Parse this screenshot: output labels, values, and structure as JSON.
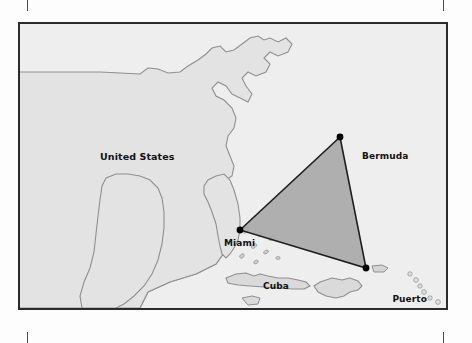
{
  "map": {
    "title": "Bermuda Triangle Map",
    "frame": {
      "border_color": "#2b2b2b"
    },
    "colors": {
      "ocean": "#eeeeee",
      "land": "#e3e3e3",
      "coastline": "#8f8f8f",
      "triangle_fill": "#a9a9a9",
      "triangle_stroke": "#1e1e1e",
      "label_text": "#111111",
      "marker": "#000000",
      "crop_mark": "#4a4a4a"
    },
    "labels": {
      "united_states": "United States",
      "bermuda": "Bermuda",
      "miami": "Miami",
      "cuba": "Cuba",
      "puerto_rico_line1": "Puerto",
      "puerto_rico_line2": "Rico"
    },
    "vertices": [
      {
        "name": "miami",
        "label": "Miami",
        "x": 238,
        "y": 228
      },
      {
        "name": "bermuda",
        "label": "Bermuda",
        "x": 338,
        "y": 135
      },
      {
        "name": "puerto-rico",
        "label": "Puerto Rico",
        "x": 364,
        "y": 266
      }
    ]
  }
}
